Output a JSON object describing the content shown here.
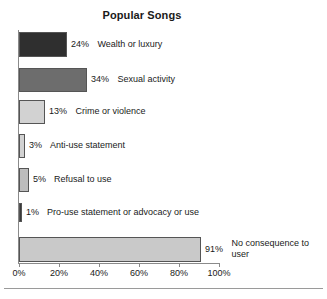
{
  "chart_data": {
    "type": "bar",
    "orientation": "horizontal",
    "title": "Popular Songs",
    "xlabel": "",
    "ylabel": "",
    "xlim": [
      0,
      100
    ],
    "grid": false,
    "legend": "none",
    "tick_labels": [
      "0%",
      "20%",
      "40%",
      "60%",
      "80%",
      "100%"
    ],
    "tick_values": [
      0,
      20,
      40,
      60,
      80,
      100
    ],
    "categories": [
      "Wealth or luxury",
      "Sexual activity",
      "Crime or violence",
      "Anti-use statement",
      "Refusal to use",
      "Pro-use statement or advocacy or use",
      "No consequence to user"
    ],
    "values": [
      24,
      34,
      13,
      3,
      5,
      1,
      91
    ],
    "value_labels": [
      "24%",
      "34%",
      "13%",
      "3%",
      "5%",
      "1%",
      "91%"
    ],
    "bar_colors": [
      "#2f2f2f",
      "#6d6d6d",
      "#d2d2d2",
      "#d2d2d2",
      "#bdbdbd",
      "#3a3a3a",
      "#c9c9c9"
    ],
    "bars": [
      {
        "category": "Wealth or luxury",
        "value": 24,
        "value_label": "24%",
        "color": "#2f2f2f",
        "top": 32,
        "height": 25,
        "label_wrap": false
      },
      {
        "category": "Sexual activity",
        "value": 34,
        "value_label": "34%",
        "color": "#6d6d6d",
        "top": 68,
        "height": 24,
        "label_wrap": false
      },
      {
        "category": "Crime or violence",
        "value": 13,
        "value_label": "13%",
        "color": "#d2d2d2",
        "top": 100,
        "height": 24,
        "label_wrap": false
      },
      {
        "category": "Anti-use statement",
        "value": 3,
        "value_label": "3%",
        "color": "#d2d2d2",
        "top": 134,
        "height": 24,
        "label_wrap": false
      },
      {
        "category": "Refusal to use",
        "value": 5,
        "value_label": "5%",
        "color": "#bdbdbd",
        "top": 168,
        "height": 24,
        "label_wrap": false
      },
      {
        "category": "Pro-use statement or advocacy or use",
        "value": 1,
        "value_label": "1%",
        "color": "#3a3a3a",
        "top": 203,
        "height": 19,
        "label_wrap": false
      },
      {
        "category": "No consequence to user",
        "value": 91,
        "value_label": "91%",
        "color": "#c9c9c9",
        "top": 237,
        "height": 25,
        "label_wrap": true
      }
    ]
  }
}
